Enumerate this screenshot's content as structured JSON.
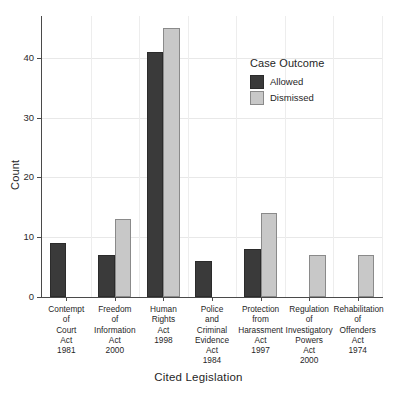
{
  "chart_data": {
    "type": "bar",
    "title": "",
    "xlabel": "Cited Legislation",
    "ylabel": "Count",
    "ylim": [
      0,
      47
    ],
    "yticks": [
      0,
      10,
      20,
      30,
      40
    ],
    "ytick_labels": [
      "0",
      "10",
      "20",
      "30",
      "40"
    ],
    "grid": true,
    "legend_title": "Case Outcome",
    "legend_position": "inside-top-right",
    "grouping": "grouped",
    "categories": [
      "Contempt\nof\nCourt\nAct\n1981",
      "Freedom\nof\nInformation\nAct\n2000",
      "Human\nRights\nAct\n1998",
      "Police\nand\nCriminal\nEvidence\nAct\n1984",
      "Protection\nfrom\nHarassment\nAct\n1997",
      "Regulation\nof\nInvestigatory\nPowers\nAct\n2000",
      "Rehabilitation\nof\nOffenders\nAct\n1974"
    ],
    "series": [
      {
        "name": "Allowed",
        "color": "#3a3a3a",
        "values": [
          9,
          7,
          41,
          6,
          8,
          0,
          0
        ]
      },
      {
        "name": "Dismissed",
        "color": "#c8c8c8",
        "values": [
          0,
          13,
          45,
          0,
          14,
          7,
          7
        ]
      }
    ]
  },
  "axes": {
    "y_title": "Count",
    "x_title": "Cited Legislation"
  },
  "legend": {
    "title": "Case Outcome",
    "entries": [
      {
        "label": "Allowed",
        "color": "#3a3a3a"
      },
      {
        "label": "Dismissed",
        "color": "#c8c8c8"
      }
    ]
  },
  "colors": {
    "allowed": "#3a3a3a",
    "dismissed": "#c8c8c8",
    "axis": "#4a4a4a",
    "grid": "#e8e8e8",
    "background": "#ffffff"
  }
}
